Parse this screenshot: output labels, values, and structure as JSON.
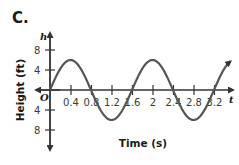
{
  "panel": {
    "label": "C."
  },
  "chart_data": {
    "type": "line",
    "title": "",
    "xlabel": "Time (s)",
    "ylabel": "Height (ft)",
    "x_var": "t",
    "y_var": "h",
    "origin_label": "O",
    "x_ticks": [
      "0.4",
      "0.8",
      "1.2",
      "1.6",
      "2",
      "2.4",
      "2.8",
      "3.2"
    ],
    "y_ticks": [
      "8",
      "4",
      "4",
      "8"
    ],
    "y_tick_values": [
      8,
      4,
      -4,
      -8
    ],
    "xlim": [
      0,
      3.3
    ],
    "ylim": [
      -10,
      11
    ],
    "grid": false,
    "function": "h = 6 sin(1.25 π t)",
    "amplitude": 6,
    "period": 1.6,
    "series": [
      {
        "name": "h(t)",
        "x": [
          0,
          0.4,
          0.8,
          1.2,
          1.6,
          2.0,
          2.4,
          2.8,
          3.2
        ],
        "values": [
          0,
          6,
          0,
          -6,
          0,
          6,
          0,
          -6,
          0
        ]
      }
    ],
    "color": "#555555"
  }
}
